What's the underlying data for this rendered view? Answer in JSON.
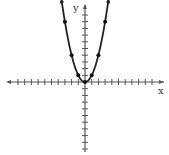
{
  "chart_data": {
    "type": "line",
    "title": "",
    "function": "y = x^2",
    "xlabel": "x",
    "ylabel": "y",
    "grid": false,
    "xlim": [
      -11,
      12
    ],
    "ylim": [
      -10,
      11
    ],
    "x_tick_step": 1,
    "y_tick_step": 1,
    "series": [
      {
        "name": "parabola",
        "x": [
          -3,
          -2,
          -1,
          0,
          1,
          2,
          3
        ],
        "y": [
          9,
          4,
          1,
          0,
          1,
          4,
          9
        ]
      }
    ],
    "arrows_at_ends": true
  },
  "labels": {
    "x_axis": "x",
    "y_axis": "y"
  },
  "colors": {
    "axis": "#555555",
    "curve": "#222222",
    "points": "#111111"
  }
}
